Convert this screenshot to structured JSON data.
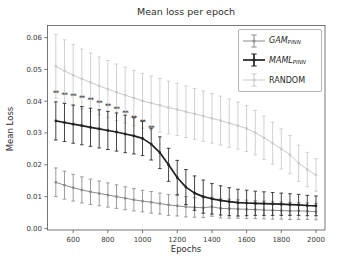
{
  "chart_data": {
    "type": "line",
    "title": "Mean loss per epoch",
    "xlabel": "Epochs",
    "ylabel": "Mean Loss",
    "grid": false,
    "legend_position": "upper right",
    "xlim": [
      452,
      2052
    ],
    "ylim": [
      -0.0005,
      0.0638
    ],
    "xticks": [
      600,
      800,
      1000,
      1200,
      1400,
      1600,
      1800,
      2000
    ],
    "xtick_labels": [
      "600",
      "800",
      "1000",
      "1200",
      "1400",
      "1600",
      "1800",
      "2000"
    ],
    "yticks": [
      0.0,
      0.01,
      0.02,
      0.03,
      0.04,
      0.05,
      0.06
    ],
    "ytick_labels": [
      "0.00",
      "0.01",
      "0.02",
      "0.03",
      "0.04",
      "0.05",
      "0.06"
    ],
    "x": [
      500,
      550,
      600,
      650,
      700,
      750,
      800,
      850,
      900,
      950,
      1000,
      1050,
      1100,
      1150,
      1200,
      1250,
      1300,
      1350,
      1400,
      1450,
      1500,
      1550,
      1600,
      1650,
      1700,
      1750,
      1800,
      1850,
      1900,
      1950,
      2000
    ],
    "series": [
      {
        "name": "GAM_PINN",
        "color": "#8a8a8a",
        "line_width": 1.0,
        "values": [
          0.0145,
          0.0136,
          0.0128,
          0.0121,
          0.0115,
          0.011,
          0.0105,
          0.01,
          0.0095,
          0.009,
          0.0086,
          0.0082,
          0.0078,
          0.0074,
          0.0071,
          0.0068,
          0.0066,
          0.0065,
          0.0068,
          0.0063,
          0.0062,
          0.0061,
          0.006,
          0.0059,
          0.0058,
          0.0057,
          0.0056,
          0.0055,
          0.0055,
          0.0054,
          0.0053
        ],
        "errors": [
          0.0045,
          0.0044,
          0.0042,
          0.0041,
          0.004,
          0.0039,
          0.0038,
          0.0037,
          0.0036,
          0.0035,
          0.0034,
          0.0034,
          0.0033,
          0.0033,
          0.0032,
          0.0032,
          0.0031,
          0.0031,
          0.003,
          0.003,
          0.003,
          0.0029,
          0.0029,
          0.0028,
          0.0028,
          0.0028,
          0.0027,
          0.0027,
          0.0027,
          0.0026,
          0.0026
        ]
      },
      {
        "name": "MAML_PINN",
        "color": "#222222",
        "line_width": 1.7,
        "values": [
          0.0338,
          0.0333,
          0.0328,
          0.0323,
          0.0318,
          0.0313,
          0.0308,
          0.0303,
          0.0297,
          0.0291,
          0.0283,
          0.0265,
          0.0238,
          0.02,
          0.016,
          0.013,
          0.0111,
          0.01,
          0.0093,
          0.0088,
          0.0084,
          0.0081,
          0.008,
          0.0079,
          0.0078,
          0.0077,
          0.0076,
          0.0075,
          0.0074,
          0.0072,
          0.0071
        ],
        "errors": [
          0.006,
          0.006,
          0.006,
          0.006,
          0.006,
          0.006,
          0.006,
          0.006,
          0.0059,
          0.0057,
          0.0054,
          0.005,
          0.005,
          0.0052,
          0.0054,
          0.0055,
          0.0054,
          0.0052,
          0.0048,
          0.0046,
          0.0044,
          0.0042,
          0.004,
          0.0038,
          0.0037,
          0.0036,
          0.0035,
          0.0034,
          0.0033,
          0.0032,
          0.0031
        ]
      },
      {
        "name": "RANDOM",
        "color": "#c9c9c9",
        "line_width": 1.0,
        "values": [
          0.051,
          0.0495,
          0.0482,
          0.047,
          0.0459,
          0.0448,
          0.0438,
          0.0428,
          0.0419,
          0.041,
          0.0401,
          0.0394,
          0.0387,
          0.038,
          0.0374,
          0.0367,
          0.036,
          0.0353,
          0.0346,
          0.0339,
          0.0331,
          0.0323,
          0.0314,
          0.0301,
          0.0285,
          0.0268,
          0.025,
          0.0232,
          0.0205,
          0.0185,
          0.0168
        ],
        "errors": [
          0.01,
          0.0098,
          0.0096,
          0.0094,
          0.0092,
          0.0091,
          0.009,
          0.0089,
          0.0088,
          0.0087,
          0.0086,
          0.0085,
          0.0084,
          0.0083,
          0.0082,
          0.0081,
          0.008,
          0.0079,
          0.0078,
          0.0077,
          0.0076,
          0.0074,
          0.0072,
          0.007,
          0.0068,
          0.0066,
          0.0063,
          0.006,
          0.0057,
          0.0054,
          0.0051
        ]
      }
    ],
    "annotations": {
      "symbol": "**",
      "color": "#4a4a4a",
      "points": [
        {
          "x": 500,
          "y": 0.0425
        },
        {
          "x": 550,
          "y": 0.0421
        },
        {
          "x": 600,
          "y": 0.0416
        },
        {
          "x": 650,
          "y": 0.041
        },
        {
          "x": 700,
          "y": 0.0403
        },
        {
          "x": 750,
          "y": 0.0395
        },
        {
          "x": 800,
          "y": 0.0386
        },
        {
          "x": 850,
          "y": 0.0375
        },
        {
          "x": 900,
          "y": 0.0362
        },
        {
          "x": 950,
          "y": 0.0349
        },
        {
          "x": 1000,
          "y": 0.0334
        },
        {
          "x": 1050,
          "y": 0.0315
        }
      ]
    },
    "draw_order": [
      2,
      0,
      1
    ]
  },
  "legend": {
    "entries": [
      {
        "main": "GAM",
        "sub": "PINN",
        "italic": true,
        "color": "#8a8a8a",
        "lw": 1.0
      },
      {
        "main": "MAML",
        "sub": "PINN",
        "italic": true,
        "color": "#222222",
        "lw": 1.7
      },
      {
        "main": "RANDOM",
        "sub": "",
        "italic": false,
        "color": "#c9c9c9",
        "lw": 1.0
      }
    ]
  },
  "colors": {
    "spine": "#555555",
    "tick_label": "#3a3a3a",
    "background": "#ffffff"
  }
}
